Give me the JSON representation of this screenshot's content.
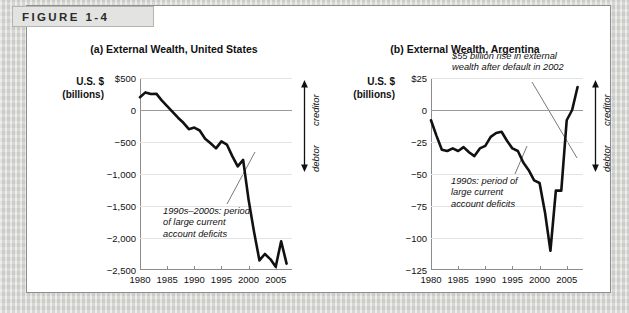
{
  "figure": {
    "banner_label": "FIGURE 1-4"
  },
  "panels": [
    {
      "id": "us",
      "title": "(a) External Wealth, United States",
      "axis_label_line1": "U.S. $",
      "axis_label_line2": "(billions)",
      "creditor_label": "creditor",
      "debtor_label": "debtor",
      "annotation": "1990s–2000s: period\nof large current\naccount deficits"
    },
    {
      "id": "argentina",
      "title": "(b) External Wealth, Argentina",
      "axis_label_line1": "U.S. $",
      "axis_label_line2": "(billions)",
      "creditor_label": "creditor",
      "debtor_label": "debtor",
      "annotation_top": "$55 billion rise in external\nwealth after default in 2002",
      "annotation_mid": "1990s: period of\nlarge current\naccount deficits"
    }
  ],
  "chart_data": [
    {
      "type": "line",
      "title": "(a) External Wealth, United States",
      "xlabel": "",
      "ylabel": "U.S. $ (billions)",
      "xlim": [
        1980,
        2008
      ],
      "ylim": [
        -2500,
        500
      ],
      "yticks": [
        500,
        0,
        -500,
        -1000,
        -1500,
        -2000,
        -2500
      ],
      "ytick_labels": [
        "$500",
        "0",
        "−500",
        "−1,000",
        "−1,500",
        "−2,000",
        "−2,500"
      ],
      "xticks": [
        1980,
        1985,
        1990,
        1995,
        2000,
        2005
      ],
      "xtick_labels": [
        "1980",
        "1985",
        "1990",
        "1995",
        "2000",
        "2005"
      ],
      "grid": true,
      "legend": "none",
      "zero_reference_line": 0,
      "series": [
        {
          "name": "US external wealth",
          "x": [
            1980,
            1981,
            1982,
            1983,
            1984,
            1985,
            1986,
            1987,
            1988,
            1989,
            1990,
            1991,
            1992,
            1993,
            1994,
            1995,
            1996,
            1997,
            1998,
            1999,
            2000,
            2001,
            2002,
            2003,
            2004,
            2005,
            2006,
            2007
          ],
          "values": [
            200,
            275,
            250,
            255,
            150,
            60,
            -30,
            -120,
            -200,
            -300,
            -275,
            -320,
            -450,
            -520,
            -600,
            -490,
            -540,
            -720,
            -880,
            -780,
            -1400,
            -1900,
            -2350,
            -2250,
            -2330,
            -2450,
            -2050,
            -2400
          ]
        }
      ],
      "annotations": [
        {
          "text": "1990s–2000s: period of large current account deficits",
          "points_to_year": 2001
        }
      ],
      "side_labels": [
        "creditor",
        "debtor"
      ]
    },
    {
      "type": "line",
      "title": "(b) External Wealth, Argentina",
      "xlabel": "",
      "ylabel": "U.S. $ (billions)",
      "xlim": [
        1980,
        2008
      ],
      "ylim": [
        -125,
        25
      ],
      "yticks": [
        25,
        0,
        -25,
        -50,
        -75,
        -100,
        -125
      ],
      "ytick_labels": [
        "$25",
        "0",
        "−25",
        "−50",
        "−75",
        "−100",
        "−125"
      ],
      "xticks": [
        1980,
        1985,
        1990,
        1995,
        2000,
        2005
      ],
      "xtick_labels": [
        "1980",
        "1985",
        "1990",
        "1995",
        "2000",
        "2005"
      ],
      "grid": true,
      "legend": "none",
      "zero_reference_line": 0,
      "series": [
        {
          "name": "Argentina external wealth",
          "x": [
            1980,
            1981,
            1982,
            1983,
            1984,
            1985,
            1986,
            1987,
            1988,
            1989,
            1990,
            1991,
            1992,
            1993,
            1994,
            1995,
            1996,
            1997,
            1998,
            1999,
            2000,
            2001,
            2002,
            2003,
            2004,
            2005,
            2006,
            2007
          ],
          "values": [
            -8,
            -20,
            -31,
            -32,
            -30,
            -32,
            -29,
            -33,
            -36,
            -30,
            -28,
            -21,
            -18,
            -17,
            -24,
            -30,
            -32,
            -41,
            -47,
            -55,
            -57,
            -80,
            -110,
            -63,
            -63,
            -8,
            0,
            18
          ]
        }
      ],
      "annotations": [
        {
          "text": "$55 billion rise in external wealth after default in 2002",
          "points_to_year": 2003
        },
        {
          "text": "1990s: period of large current account deficits",
          "points_to_year": 1994
        }
      ],
      "side_labels": [
        "creditor",
        "debtor"
      ]
    }
  ]
}
